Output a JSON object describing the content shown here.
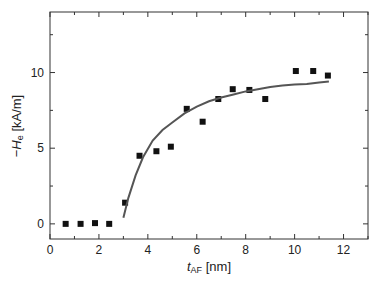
{
  "chart_data": {
    "type": "scatter",
    "title": "",
    "xlabel": "t_AF [nm]",
    "xlabel_main": "t",
    "xlabel_sub": "AF",
    "xlabel_unit": " [nm]",
    "ylabel": "-H_e [kA/m]",
    "ylabel_prefix": "−",
    "ylabel_main": "H",
    "ylabel_sub": "e",
    "ylabel_unit": " [kA/m]",
    "xlim": [
      0,
      13
    ],
    "ylim": [
      -1,
      14
    ],
    "xticks": [
      0,
      2,
      4,
      6,
      8,
      10,
      12
    ],
    "yticks": [
      0,
      5,
      10
    ],
    "x_minor_step": 1,
    "y_minor_step": 2.5,
    "grid": false,
    "legend": null,
    "series": [
      {
        "name": "measured",
        "type": "scatter",
        "marker": "square",
        "color": "#111111",
        "x": [
          0.64,
          1.25,
          1.84,
          2.42,
          3.07,
          3.66,
          4.35,
          4.94,
          5.59,
          6.24,
          6.88,
          7.47,
          8.15,
          8.8,
          10.05,
          10.76,
          11.36
        ],
        "y": [
          0.0,
          0.0,
          0.05,
          0.0,
          1.4,
          4.5,
          4.8,
          5.1,
          7.6,
          6.75,
          8.25,
          8.9,
          8.85,
          8.25,
          10.1,
          10.1,
          9.8
        ]
      },
      {
        "name": "fit",
        "type": "line",
        "color": "#555555",
        "x": [
          3.0,
          3.2,
          3.5,
          3.8,
          4.2,
          4.6,
          5.0,
          5.5,
          6.0,
          6.5,
          7.0,
          7.5,
          8.0,
          8.5,
          9.0,
          9.5,
          10.0,
          10.5,
          11.0,
          11.4
        ],
        "y": [
          0.4,
          1.7,
          3.2,
          4.4,
          5.5,
          6.2,
          6.7,
          7.3,
          7.75,
          8.1,
          8.35,
          8.55,
          8.75,
          8.9,
          9.05,
          9.15,
          9.2,
          9.25,
          9.35,
          9.4
        ]
      }
    ]
  }
}
